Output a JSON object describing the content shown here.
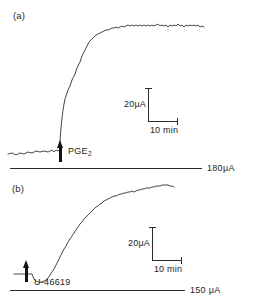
{
  "figure": {
    "width": 257,
    "height": 306,
    "background": "#ffffff",
    "ink_color": "#232323"
  },
  "panels": [
    {
      "id": "a",
      "label": "(a)",
      "agonist": "PGE",
      "agonist_subscript": "2",
      "reference_label": "180μA",
      "scale_y_label": "20μA",
      "scale_x_label": "10 min"
    },
    {
      "id": "b",
      "label": "(b)",
      "agonist": "U-46619",
      "agonist_subscript": "",
      "reference_label": "150 μA",
      "scale_y_label": "20μA",
      "scale_x_label": "10 min"
    }
  ],
  "chart_data": {
    "type": "line",
    "title": "",
    "xlabel": "time",
    "ylabel": "short-circuit current",
    "subplots": [
      {
        "name": "a",
        "label": "(a)",
        "stimulus": "PGE2",
        "stimulus_time_min": 10,
        "scale_bar": {
          "current_uA": 20,
          "time_min": 10
        },
        "reference_line_uA": 180,
        "description": "Noisy flat baseline, abrupt step-like rise at PGE2 application, rapid climb to a noisy sustained plateau.",
        "axis_hint": {
          "x_units": "min",
          "y_units": "uA",
          "grid": false
        },
        "points": [
          [
            8,
            154
          ],
          [
            12,
            153
          ],
          [
            16,
            155
          ],
          [
            20,
            153
          ],
          [
            24,
            154
          ],
          [
            28,
            152
          ],
          [
            32,
            153
          ],
          [
            36,
            151
          ],
          [
            40,
            152
          ],
          [
            44,
            151
          ],
          [
            48,
            152
          ],
          [
            52,
            150
          ],
          [
            54,
            152
          ],
          [
            56,
            150
          ],
          [
            58,
            151
          ],
          [
            59,
            150
          ],
          [
            60,
            149
          ],
          [
            60,
            140
          ],
          [
            61,
            128
          ],
          [
            62,
            118
          ],
          [
            63,
            110
          ],
          [
            64,
            104
          ],
          [
            65,
            99
          ],
          [
            66,
            96
          ],
          [
            67,
            93
          ],
          [
            68,
            90
          ],
          [
            69,
            88
          ],
          [
            70,
            86
          ],
          [
            71,
            83
          ],
          [
            72,
            80
          ],
          [
            73,
            78
          ],
          [
            74,
            76
          ],
          [
            75,
            74
          ],
          [
            76,
            71
          ],
          [
            77,
            68
          ],
          [
            78,
            66
          ],
          [
            79,
            64
          ],
          [
            80,
            62
          ],
          [
            81,
            59
          ],
          [
            82,
            56
          ],
          [
            83,
            54
          ],
          [
            84,
            52
          ],
          [
            85,
            50
          ],
          [
            86,
            48
          ],
          [
            87,
            46
          ],
          [
            88,
            44
          ],
          [
            89,
            42
          ],
          [
            90,
            41
          ],
          [
            92,
            39
          ],
          [
            94,
            37
          ],
          [
            96,
            35
          ],
          [
            98,
            34
          ],
          [
            100,
            33
          ],
          [
            102,
            32
          ],
          [
            104,
            31
          ],
          [
            106,
            30
          ],
          [
            108,
            30
          ],
          [
            110,
            29
          ],
          [
            112,
            28
          ],
          [
            114,
            28
          ],
          [
            116,
            27
          ],
          [
            118,
            28
          ],
          [
            120,
            27
          ],
          [
            122,
            26
          ],
          [
            124,
            27
          ],
          [
            126,
            26
          ],
          [
            128,
            25
          ],
          [
            130,
            26
          ],
          [
            132,
            25
          ],
          [
            134,
            26
          ],
          [
            136,
            25
          ],
          [
            138,
            26
          ],
          [
            140,
            25
          ],
          [
            142,
            26
          ],
          [
            144,
            25
          ],
          [
            146,
            26
          ],
          [
            148,
            25
          ],
          [
            150,
            26
          ],
          [
            152,
            25
          ],
          [
            154,
            26
          ],
          [
            156,
            25
          ],
          [
            158,
            24
          ],
          [
            160,
            26
          ],
          [
            162,
            25
          ],
          [
            164,
            26
          ],
          [
            166,
            25
          ],
          [
            168,
            27
          ],
          [
            170,
            25
          ],
          [
            172,
            26
          ],
          [
            174,
            25
          ],
          [
            176,
            26
          ],
          [
            178,
            24
          ],
          [
            180,
            26
          ],
          [
            182,
            25
          ],
          [
            184,
            27
          ],
          [
            186,
            25
          ],
          [
            188,
            26
          ],
          [
            190,
            25
          ],
          [
            192,
            26
          ],
          [
            194,
            25
          ],
          [
            196,
            26
          ],
          [
            198,
            25
          ],
          [
            200,
            27
          ],
          [
            202,
            26
          ],
          [
            204,
            27
          ]
        ]
      },
      {
        "name": "b",
        "label": "(b)",
        "stimulus": "U-46619",
        "stimulus_time_min": 6,
        "scale_bar": {
          "current_uA": 20,
          "time_min": 10
        },
        "reference_line_uA": 150,
        "description": "Short flat baseline with a small downward step, then a smooth sigmoid rise that gradually saturates.",
        "axis_hint": {
          "x_units": "min",
          "y_units": "uA",
          "grid": false
        },
        "points": [
          [
            14,
            98
          ],
          [
            20,
            98
          ],
          [
            26,
            98
          ],
          [
            30,
            98
          ],
          [
            32,
            98
          ],
          [
            34,
            103
          ],
          [
            36,
            105
          ],
          [
            38,
            106
          ],
          [
            40,
            106
          ],
          [
            42,
            106
          ],
          [
            44,
            105
          ],
          [
            46,
            104
          ],
          [
            48,
            102
          ],
          [
            50,
            99
          ],
          [
            52,
            96
          ],
          [
            54,
            93
          ],
          [
            56,
            89
          ],
          [
            58,
            85
          ],
          [
            60,
            81
          ],
          [
            62,
            77
          ],
          [
            64,
            73
          ],
          [
            66,
            70
          ],
          [
            68,
            66
          ],
          [
            70,
            63
          ],
          [
            72,
            60
          ],
          [
            74,
            57
          ],
          [
            76,
            54
          ],
          [
            78,
            51
          ],
          [
            80,
            48
          ],
          [
            82,
            46
          ],
          [
            84,
            43
          ],
          [
            86,
            41
          ],
          [
            88,
            39
          ],
          [
            90,
            37
          ],
          [
            92,
            35
          ],
          [
            94,
            33
          ],
          [
            96,
            31
          ],
          [
            98,
            30
          ],
          [
            100,
            28
          ],
          [
            102,
            27
          ],
          [
            104,
            25
          ],
          [
            106,
            24
          ],
          [
            108,
            23
          ],
          [
            110,
            22
          ],
          [
            112,
            21
          ],
          [
            114,
            20
          ],
          [
            116,
            20
          ],
          [
            118,
            19
          ],
          [
            120,
            18
          ],
          [
            122,
            18
          ],
          [
            124,
            17
          ],
          [
            126,
            17
          ],
          [
            128,
            16
          ],
          [
            130,
            16
          ],
          [
            132,
            15
          ],
          [
            134,
            16
          ],
          [
            136,
            15
          ],
          [
            138,
            14
          ],
          [
            140,
            14
          ],
          [
            142,
            13
          ],
          [
            144,
            13
          ],
          [
            146,
            12
          ],
          [
            148,
            12
          ],
          [
            150,
            12
          ],
          [
            152,
            11
          ],
          [
            154,
            11
          ],
          [
            156,
            10
          ],
          [
            158,
            10
          ],
          [
            160,
            10
          ],
          [
            162,
            9
          ],
          [
            164,
            9
          ],
          [
            166,
            9
          ],
          [
            168,
            9
          ],
          [
            170,
            10
          ],
          [
            172,
            10
          ],
          [
            174,
            11
          ]
        ]
      }
    ]
  }
}
